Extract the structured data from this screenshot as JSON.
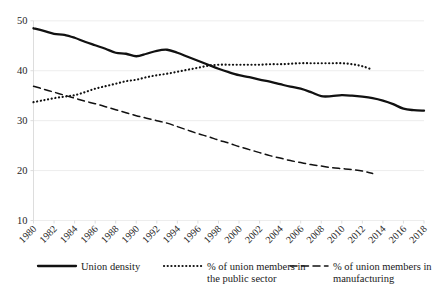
{
  "chart_data": {
    "type": "line",
    "title": "",
    "subtitle": "",
    "xlabel": "",
    "ylabel": "",
    "xlim": [
      1980,
      2018
    ],
    "ylim": [
      10,
      50
    ],
    "grid": true,
    "grid_axis": "y",
    "legend_position": "bottom",
    "y_ticks": [
      "50",
      "40",
      "30",
      "20",
      "10"
    ],
    "y_tick_values": [
      50,
      40,
      30,
      20,
      10
    ],
    "x_ticks": [
      "1980",
      "1982",
      "1984",
      "1986",
      "1988",
      "1990",
      "1992",
      "1994",
      "1996",
      "1998",
      "2000",
      "2002",
      "2004",
      "2006",
      "2008",
      "2010",
      "2012",
      "2014",
      "2016",
      "2018"
    ],
    "x_tick_values": [
      1980,
      1982,
      1984,
      1986,
      1988,
      1990,
      1992,
      1994,
      1996,
      1998,
      2000,
      2002,
      2004,
      2006,
      2008,
      2010,
      2012,
      2014,
      2016,
      2018
    ],
    "series": [
      {
        "name": "Union density",
        "style": "solid",
        "color": "#111111",
        "x": [
          1980,
          1981,
          1982,
          1983,
          1984,
          1985,
          1986,
          1987,
          1988,
          1989,
          1990,
          1991,
          1992,
          1993,
          1994,
          1995,
          1996,
          1997,
          1998,
          1999,
          2000,
          2001,
          2002,
          2003,
          2004,
          2005,
          2006,
          2007,
          2008,
          2009,
          2010,
          2011,
          2012,
          2013,
          2014,
          2015,
          2016,
          2017,
          2018
        ],
        "values": [
          48.5,
          48.0,
          47.4,
          47.2,
          46.6,
          45.8,
          45.1,
          44.4,
          43.6,
          43.4,
          42.9,
          43.4,
          44.0,
          44.2,
          43.6,
          42.8,
          42.0,
          41.2,
          40.4,
          39.7,
          39.1,
          38.7,
          38.2,
          37.8,
          37.3,
          36.8,
          36.4,
          35.7,
          34.9,
          34.9,
          35.1,
          35.0,
          34.8,
          34.5,
          34.0,
          33.3,
          32.4,
          32.1,
          32.0
        ]
      },
      {
        "name": "% of union members in the public sector",
        "style": "dotted",
        "color": "#111111",
        "x": [
          1980,
          1981,
          1982,
          1983,
          1984,
          1985,
          1986,
          1987,
          1988,
          1989,
          1990,
          1991,
          1992,
          1993,
          1994,
          1995,
          1996,
          1997,
          1998,
          1999,
          2000,
          2001,
          2002,
          2003,
          2004,
          2005,
          2006,
          2007,
          2008,
          2009,
          2010,
          2011,
          2012,
          2013
        ],
        "values": [
          33.7,
          34.1,
          34.5,
          34.8,
          35.1,
          35.7,
          36.4,
          36.9,
          37.4,
          37.9,
          38.2,
          38.7,
          39.1,
          39.4,
          39.8,
          40.2,
          40.6,
          41.0,
          41.2,
          41.2,
          41.2,
          41.2,
          41.2,
          41.3,
          41.3,
          41.4,
          41.5,
          41.5,
          41.5,
          41.5,
          41.5,
          41.3,
          40.9,
          40.2
        ]
      },
      {
        "name": "% of union members in manufacturing",
        "style": "dashed",
        "color": "#111111",
        "x": [
          1980,
          1981,
          1982,
          1983,
          1984,
          1985,
          1986,
          1987,
          1988,
          1989,
          1990,
          1991,
          1992,
          1993,
          1994,
          1995,
          1996,
          1997,
          1998,
          1999,
          2000,
          2001,
          2002,
          2003,
          2004,
          2005,
          2006,
          2007,
          2008,
          2009,
          2010,
          2011,
          2012,
          2013
        ],
        "values": [
          36.9,
          36.3,
          35.7,
          35.1,
          34.5,
          33.9,
          33.4,
          32.8,
          32.2,
          31.6,
          31.0,
          30.5,
          30.0,
          29.5,
          28.8,
          28.1,
          27.4,
          26.8,
          26.1,
          25.5,
          24.8,
          24.2,
          23.6,
          23.0,
          22.5,
          22.0,
          21.6,
          21.2,
          20.9,
          20.6,
          20.4,
          20.2,
          19.9,
          19.4
        ]
      }
    ],
    "legend": [
      {
        "label_line1": "Union density",
        "label_line2": "",
        "style": "solid"
      },
      {
        "label_line1": "% of union members in",
        "label_line2": "the public sector",
        "style": "dotted"
      },
      {
        "label_line1": "% of union members in",
        "label_line2": "manufacturing",
        "style": "dashed"
      }
    ]
  }
}
